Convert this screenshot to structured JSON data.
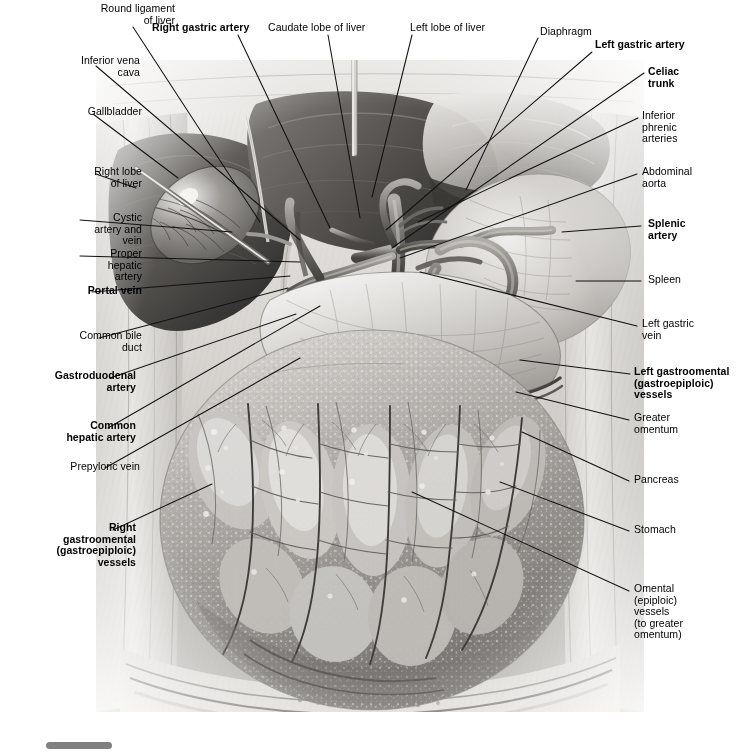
{
  "plate": {
    "title": "Abdominal viscera: stomach, liver, greater omentum and celiac vasculature",
    "style": "grayscale anatomical illustration",
    "canvas": {
      "width": 736,
      "height": 752
    }
  },
  "colors": {
    "background": "#ffffff",
    "ink": "#000000",
    "leader": "#111111",
    "scrollbar_thumb": "#808080",
    "tissue_light": "#f2f0ee",
    "tissue_mid": "#b9b6b2",
    "tissue_dark": "#5d5a57",
    "tissue_darkest": "#2f2d2b"
  },
  "labels": [
    {
      "id": "round-ligament-of-liver",
      "text": "Round ligament\nof liver",
      "bold": false,
      "align": "right",
      "x": 57,
      "y": 3,
      "leader": [
        [
          133,
          27
        ],
        [
          260,
          222
        ]
      ]
    },
    {
      "id": "right-gastric-artery",
      "text": "Right gastric artery",
      "bold": true,
      "align": "left",
      "x": 152,
      "y": 22,
      "leader": [
        [
          238,
          35
        ],
        [
          330,
          228
        ]
      ]
    },
    {
      "id": "caudate-lobe-of-liver",
      "text": "Caudate lobe of liver",
      "bold": false,
      "align": "left",
      "x": 268,
      "y": 22,
      "leader": [
        [
          328,
          35
        ],
        [
          360,
          218
        ]
      ]
    },
    {
      "id": "left-lobe-of-liver",
      "text": "Left lobe of liver",
      "bold": false,
      "align": "left",
      "x": 410,
      "y": 22,
      "leader": [
        [
          412,
          35
        ],
        [
          372,
          197
        ]
      ]
    },
    {
      "id": "diaphragm",
      "text": "Diaphragm",
      "bold": false,
      "align": "left",
      "x": 540,
      "y": 26,
      "leader": [
        [
          538,
          38
        ],
        [
          466,
          190
        ]
      ]
    },
    {
      "id": "left-gastric-artery",
      "text": "Left gastric artery",
      "bold": true,
      "align": "left",
      "x": 595,
      "y": 39,
      "leader": [
        [
          592,
          52
        ],
        [
          386,
          230
        ]
      ]
    },
    {
      "id": "inferior-vena-cava",
      "text": "Inferior vena\ncava",
      "bold": false,
      "align": "right",
      "x": 22,
      "y": 55,
      "leader": [
        [
          96,
          66
        ],
        [
          300,
          240
        ]
      ]
    },
    {
      "id": "celiac-trunk",
      "text": "Celiac\ntrunk",
      "bold": true,
      "align": "left",
      "x": 648,
      "y": 66,
      "leader": [
        [
          644,
          73
        ],
        [
          392,
          248
        ]
      ]
    },
    {
      "id": "inferior-phrenic-arteries",
      "text": "Inferior\nphrenic\narteries",
      "bold": false,
      "align": "left",
      "x": 642,
      "y": 110,
      "leader": [
        [
          638,
          118
        ],
        [
          418,
          222
        ]
      ]
    },
    {
      "id": "gallbladder",
      "text": "Gallbladder",
      "bold": false,
      "align": "right",
      "x": 24,
      "y": 106,
      "leader": [
        [
          93,
          114
        ],
        [
          178,
          178
        ]
      ]
    },
    {
      "id": "abdominal-aorta",
      "text": "Abdominal\naorta",
      "bold": false,
      "align": "left",
      "x": 642,
      "y": 166,
      "leader": [
        [
          637,
          174
        ],
        [
          400,
          258
        ]
      ]
    },
    {
      "id": "right-lobe-of-liver",
      "text": "Right lobe\nof liver",
      "bold": false,
      "align": "right",
      "x": 24,
      "y": 166,
      "leader": [
        [
          96,
          174
        ],
        [
          136,
          188
        ]
      ]
    },
    {
      "id": "splenic-artery",
      "text": "Splenic\nartery",
      "bold": true,
      "align": "left",
      "x": 648,
      "y": 218,
      "leader": [
        [
          641,
          226
        ],
        [
          562,
          232
        ]
      ]
    },
    {
      "id": "cystic-artery-and-vein",
      "text": "Cystic\nartery and\nvein",
      "bold": false,
      "align": "right",
      "x": 24,
      "y": 212,
      "leader": [
        [
          80,
          220
        ],
        [
          232,
          232
        ]
      ]
    },
    {
      "id": "proper-hepatic-artery",
      "text": "Proper\nhepatic\nartery",
      "bold": false,
      "align": "right",
      "x": 24,
      "y": 248,
      "leader": [
        [
          80,
          256
        ],
        [
          300,
          262
        ]
      ]
    },
    {
      "id": "spleen",
      "text": "Spleen",
      "bold": false,
      "align": "left",
      "x": 648,
      "y": 274,
      "leader": [
        [
          641,
          281
        ],
        [
          576,
          281
        ]
      ]
    },
    {
      "id": "portal-vein",
      "text": "Portal vein",
      "bold": true,
      "align": "right",
      "x": 24,
      "y": 285,
      "leader": [
        [
          92,
          292
        ],
        [
          290,
          276
        ]
      ]
    },
    {
      "id": "left-gastric-vein",
      "text": "Left gastric\nvein",
      "bold": false,
      "align": "left",
      "x": 642,
      "y": 318,
      "leader": [
        [
          637,
          326
        ],
        [
          420,
          272
        ]
      ]
    },
    {
      "id": "common-bile-duct",
      "text": "Common bile\nduct",
      "bold": false,
      "align": "right",
      "x": 24,
      "y": 330,
      "leader": [
        [
          99,
          338
        ],
        [
          288,
          288
        ]
      ]
    },
    {
      "id": "left-gastroomental-vessels",
      "text": "Left gastroomental\n(gastroepiploic)\nvessels",
      "bold": true,
      "align": "left",
      "x": 634,
      "y": 366,
      "leader": [
        [
          630,
          374
        ],
        [
          520,
          360
        ]
      ]
    },
    {
      "id": "gastroduodenal-artery",
      "text": "Gastroduodenal\nartery",
      "bold": true,
      "align": "right",
      "x": 18,
      "y": 370,
      "leader": [
        [
          110,
          378
        ],
        [
          296,
          314
        ]
      ]
    },
    {
      "id": "greater-omentum",
      "text": "Greater\nomentum",
      "bold": false,
      "align": "left",
      "x": 634,
      "y": 412,
      "leader": [
        [
          629,
          420
        ],
        [
          516,
          392
        ]
      ]
    },
    {
      "id": "common-hepatic-artery",
      "text": "Common\nhepatic artery",
      "bold": true,
      "align": "right",
      "x": 18,
      "y": 420,
      "leader": [
        [
          108,
          428
        ],
        [
          320,
          306
        ]
      ]
    },
    {
      "id": "prepyloric-vein",
      "text": "Prepyloric vein",
      "bold": false,
      "align": "right",
      "x": 22,
      "y": 461,
      "leader": [
        [
          105,
          468
        ],
        [
          300,
          358
        ]
      ]
    },
    {
      "id": "pancreas",
      "text": "Pancreas",
      "bold": false,
      "align": "left",
      "x": 634,
      "y": 474,
      "leader": [
        [
          629,
          481
        ],
        [
          522,
          432
        ]
      ]
    },
    {
      "id": "stomach",
      "text": "Stomach",
      "bold": false,
      "align": "left",
      "x": 634,
      "y": 524,
      "leader": [
        [
          629,
          531
        ],
        [
          500,
          482
        ]
      ]
    },
    {
      "id": "right-gastroomental-vessels",
      "text": "Right\ngastroomental\n(gastroepiploic)\nvessels",
      "bold": true,
      "align": "right",
      "x": 18,
      "y": 522,
      "leader": [
        [
          113,
          530
        ],
        [
          212,
          484
        ]
      ]
    },
    {
      "id": "omental-vessels",
      "text": "Omental\n(epiploic)\nvessels\n(to greater\nomentum)",
      "bold": false,
      "align": "left",
      "x": 634,
      "y": 583,
      "leader": [
        [
          629,
          591
        ],
        [
          412,
          492
        ]
      ]
    }
  ],
  "scrollbar": {
    "name": "horizontal-scrollbar",
    "thumb_present": true
  }
}
